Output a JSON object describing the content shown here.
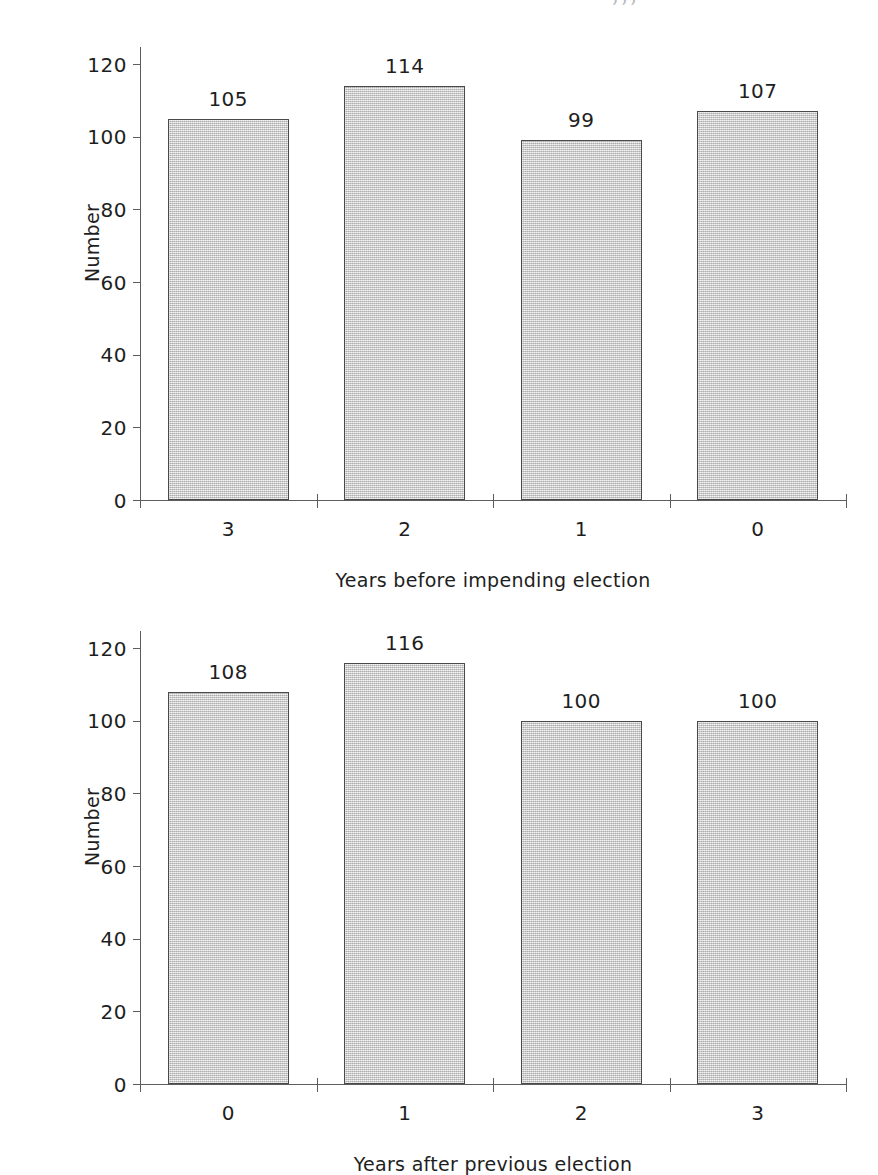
{
  "page": {
    "top_cut_text": "‚‚‚",
    "background": "#ffffff",
    "bar_fill": "#c9c9c9",
    "bar_border": "#4a4a4a",
    "axis_color": "#5d5d5d",
    "text_color": "#1e1e1e"
  },
  "chart_data": [
    {
      "type": "bar",
      "id": "years-before-impending-election",
      "title": "",
      "categories": [
        "3",
        "2",
        "1",
        "0"
      ],
      "values": [
        105,
        114,
        99,
        107
      ],
      "data_labels": [
        "105",
        "114",
        "99",
        "107"
      ],
      "xlabel": "Years before impending election",
      "ylabel": "Number",
      "ylim": [
        0,
        120
      ],
      "yticks": [
        0,
        20,
        40,
        60,
        80,
        100,
        120
      ],
      "ytick_labels": [
        "0",
        "20",
        "40",
        "60",
        "80",
        "100",
        "120"
      ],
      "grid": false,
      "legend": false
    },
    {
      "type": "bar",
      "id": "years-after-previous-election",
      "title": "",
      "categories": [
        "0",
        "1",
        "2",
        "3"
      ],
      "values": [
        108,
        116,
        100,
        100
      ],
      "data_labels": [
        "108",
        "116",
        "100",
        "100"
      ],
      "xlabel": "Years after previous election",
      "ylabel": "Number",
      "ylim": [
        0,
        120
      ],
      "yticks": [
        0,
        20,
        40,
        60,
        80,
        100,
        120
      ],
      "ytick_labels": [
        "0",
        "20",
        "40",
        "60",
        "80",
        "100",
        "120"
      ],
      "grid": false,
      "legend": false
    }
  ]
}
